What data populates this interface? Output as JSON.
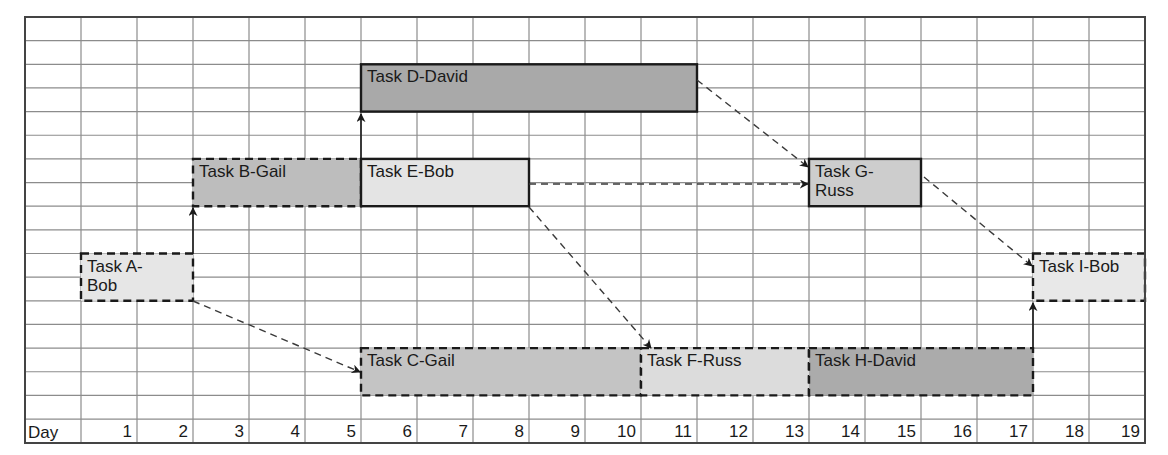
{
  "chart_data": {
    "type": "gantt",
    "title": "",
    "xlabel": "Day",
    "days": [
      1,
      2,
      3,
      4,
      5,
      6,
      7,
      8,
      9,
      10,
      11,
      12,
      13,
      14,
      15,
      16,
      17,
      18,
      19
    ],
    "grid": {
      "columns": 20,
      "rows": 17,
      "left": 25,
      "top": 17,
      "col_width": 56,
      "row_height": 23.65,
      "day_row_height": 23.5
    },
    "tasks": [
      {
        "id": "A",
        "label": "Task A-\nBob",
        "start_day": 1,
        "end_day": 2,
        "row": 10,
        "row_span": 2,
        "fill": "#e6e6e6",
        "border": "dashed"
      },
      {
        "id": "B",
        "label": "Task B-Gail",
        "start_day": 3,
        "end_day": 5,
        "row": 6,
        "row_span": 2,
        "fill": "#bdbdbd",
        "border": "dashed"
      },
      {
        "id": "C",
        "label": "Task C-Gail",
        "start_day": 6,
        "end_day": 10,
        "row": 14,
        "row_span": 2,
        "fill": "#c4c4c4",
        "border": "dashed"
      },
      {
        "id": "D",
        "label": "Task D-David",
        "start_day": 6,
        "end_day": 11,
        "row": 2,
        "row_span": 2,
        "fill": "#a9a9a9",
        "border": "solid"
      },
      {
        "id": "E",
        "label": "Task E-Bob",
        "start_day": 6,
        "end_day": 8,
        "row": 6,
        "row_span": 2,
        "fill": "#e4e4e4",
        "border": "solid"
      },
      {
        "id": "F",
        "label": "Task F-Russ",
        "start_day": 11,
        "end_day": 13,
        "row": 14,
        "row_span": 2,
        "fill": "#dcdcdc",
        "border": "dashed"
      },
      {
        "id": "G",
        "label": "Task G-\nRuss",
        "start_day": 14,
        "end_day": 15,
        "row": 6,
        "row_span": 2,
        "fill": "#cdcdcd",
        "border": "solid"
      },
      {
        "id": "H",
        "label": "Task H-David",
        "start_day": 14,
        "end_day": 17,
        "row": 14,
        "row_span": 2,
        "fill": "#ababab",
        "border": "dashed"
      },
      {
        "id": "I",
        "label": "Task I-Bob",
        "start_day": 18,
        "end_day": 19,
        "row": 10,
        "row_span": 2,
        "fill": "#e8e8e8",
        "border": "dashed"
      }
    ],
    "dependencies": [
      {
        "from": "A",
        "to": "B",
        "style": "solid",
        "points": [
          [
            193,
            254
          ],
          [
            193,
            208
          ]
        ]
      },
      {
        "from": "A",
        "to": "C",
        "style": "dashed",
        "points": [
          [
            193,
            301
          ],
          [
            360,
            372
          ]
        ]
      },
      {
        "from": "B",
        "to": "D",
        "style": "solid",
        "points": [
          [
            361,
            159
          ],
          [
            361,
            114
          ]
        ]
      },
      {
        "from": "D",
        "to": "G",
        "style": "dashed",
        "points": [
          [
            697,
            80
          ],
          [
            808,
            167
          ]
        ]
      },
      {
        "from": "E",
        "to": "G",
        "style": "dashed",
        "points": [
          [
            529,
            184
          ],
          [
            808,
            184
          ]
        ]
      },
      {
        "from": "E",
        "to": "F",
        "style": "dashed",
        "points": [
          [
            529,
            207
          ],
          [
            651,
            348
          ]
        ]
      },
      {
        "from": "G",
        "to": "I",
        "style": "dashed",
        "points": [
          [
            924,
            177
          ],
          [
            1032,
            266
          ]
        ]
      },
      {
        "from": "H",
        "to": "I",
        "style": "solid",
        "points": [
          [
            1033,
            348
          ],
          [
            1033,
            303
          ]
        ]
      }
    ]
  },
  "axis": {
    "day_header": "Day"
  }
}
